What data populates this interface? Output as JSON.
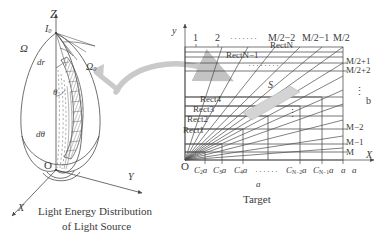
{
  "figure": {
    "background": "#ffffff",
    "line_color": "#4a4a4a",
    "arrow_color": "#b9b9b9",
    "text_color": "#3a3a3a"
  },
  "left_panel": {
    "name": "light-energy-distribution-of-light-source",
    "caption_line1": "Light Energy Distribution",
    "caption_line2": "of Light Source",
    "axes": {
      "z_label": "Z",
      "x_label": "X",
      "y_label": "Y",
      "origin_label": "O"
    },
    "labels": {
      "intensity": "I",
      "intensity_sub": "0",
      "omega": "Ω",
      "omega0": "Ω",
      "omega0_sub": "0",
      "dr": "dr",
      "theta": "θ",
      "dtheta": "dθ"
    }
  },
  "right_panel": {
    "name": "target-grid",
    "caption": "Target",
    "axes": {
      "y_label": "y",
      "x_label": "X",
      "origin_label": "O"
    },
    "top_column_labels": [
      "1",
      "2",
      "M/2−2",
      "M/2−1",
      "M/2"
    ],
    "top_dots": "·······",
    "right_row_labels": [
      "M/2+1",
      "M/2+2",
      "M−2",
      "M−1",
      "M"
    ],
    "right_vertical_dots": "⋮",
    "center_vertical_dots": "⋮",
    "mid_dots": "········",
    "rect_labels": [
      "Rect1",
      "Rect2",
      "Rect3",
      "Rect4",
      "RectN−1",
      "RectN"
    ],
    "s_label": "S",
    "side_label_b": "b",
    "bottom_dim_label": "a",
    "bottom_tick_labels": [
      {
        "base": "C",
        "sub": "2",
        "suffix": "a"
      },
      {
        "base": "C",
        "sub": "3",
        "suffix": "a"
      },
      {
        "base": "C",
        "sub": "4",
        "suffix": "a"
      },
      {
        "base": "C",
        "sub": "N−2",
        "suffix": "a"
      },
      {
        "base": "C",
        "sub": "N−1",
        "suffix": "a"
      },
      {
        "base": "a",
        "sub": "",
        "suffix": ""
      }
    ],
    "bottom_dots": "······"
  },
  "transfer_arrow": {
    "name": "mapping-arrow",
    "color": "#c3c3c3",
    "description": "curved arrow from light source to target"
  }
}
